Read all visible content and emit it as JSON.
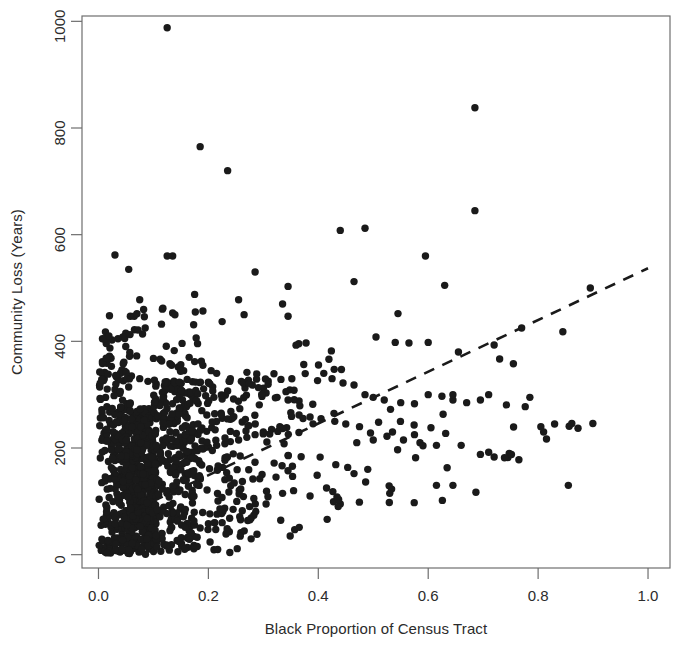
{
  "chart_data": {
    "type": "scatter",
    "title": "",
    "xlabel": "Black Proportion of Census Tract",
    "ylabel": "Community Loss (Years)",
    "xlim": [
      -0.03,
      1.04
    ],
    "ylim": [
      -25,
      1010
    ],
    "xticks": [
      0.0,
      0.2,
      0.4,
      0.6,
      0.8,
      1.0
    ],
    "xtick_labels": [
      "0.0",
      "0.2",
      "0.4",
      "0.6",
      "0.8",
      "1.0"
    ],
    "yticks": [
      0,
      200,
      400,
      600,
      800,
      1000
    ],
    "ytick_labels": [
      "0",
      "200",
      "400",
      "600",
      "800",
      "1000"
    ],
    "grid": false,
    "legend": null,
    "marker": {
      "shape": "circle",
      "size_px": 7.4,
      "color": "#1a1a1a"
    },
    "trend_line": {
      "style": "dashed",
      "color": "#1a1a1a",
      "x_start": 0.0,
      "y_start": 52,
      "x_end": 1.0,
      "y_end": 537
    },
    "points": [
      [
        0.125,
        988
      ],
      [
        0.185,
        765
      ],
      [
        0.235,
        720
      ],
      [
        0.685,
        838
      ],
      [
        0.685,
        645
      ],
      [
        0.44,
        608
      ],
      [
        0.485,
        612
      ],
      [
        0.03,
        562
      ],
      [
        0.125,
        560
      ],
      [
        0.135,
        560
      ],
      [
        0.055,
        535
      ],
      [
        0.595,
        560
      ],
      [
        0.285,
        530
      ],
      [
        0.465,
        512
      ],
      [
        0.63,
        505
      ],
      [
        0.345,
        503
      ],
      [
        0.895,
        500
      ],
      [
        0.075,
        478
      ],
      [
        0.175,
        488
      ],
      [
        0.255,
        478
      ],
      [
        0.335,
        470
      ],
      [
        0.02,
        448
      ],
      [
        0.058,
        447
      ],
      [
        0.065,
        447
      ],
      [
        0.135,
        453
      ],
      [
        0.265,
        450
      ],
      [
        0.345,
        447
      ],
      [
        0.545,
        452
      ],
      [
        0.225,
        437
      ],
      [
        0.085,
        425
      ],
      [
        0.77,
        425
      ],
      [
        0.845,
        418
      ],
      [
        0.505,
        408
      ],
      [
        0.54,
        398
      ],
      [
        0.565,
        397
      ],
      [
        0.6,
        398
      ],
      [
        0.72,
        393
      ],
      [
        0.655,
        380
      ],
      [
        0.73,
        367
      ],
      [
        0.755,
        358
      ],
      [
        0.02,
        372
      ],
      [
        0.045,
        358
      ],
      [
        0.1,
        368
      ],
      [
        0.115,
        363
      ],
      [
        0.13,
        358
      ],
      [
        0.145,
        352
      ],
      [
        0.155,
        345
      ],
      [
        0.165,
        370
      ],
      [
        0.175,
        362
      ],
      [
        0.19,
        355
      ],
      [
        0.205,
        345
      ],
      [
        0.215,
        340
      ],
      [
        0.04,
        340
      ],
      [
        0.06,
        335
      ],
      [
        0.075,
        330
      ],
      [
        0.09,
        325
      ],
      [
        0.105,
        320
      ],
      [
        0.12,
        317
      ],
      [
        0.135,
        313
      ],
      [
        0.15,
        308
      ],
      [
        0.165,
        305
      ],
      [
        0.18,
        302
      ],
      [
        0.195,
        298
      ],
      [
        0.21,
        295
      ],
      [
        0.225,
        292
      ],
      [
        0.24,
        330
      ],
      [
        0.26,
        325
      ],
      [
        0.28,
        318
      ],
      [
        0.3,
        312
      ],
      [
        0.305,
        303
      ],
      [
        0.325,
        295
      ],
      [
        0.345,
        290
      ],
      [
        0.365,
        288
      ],
      [
        0.39,
        282
      ],
      [
        0.41,
        340
      ],
      [
        0.425,
        330
      ],
      [
        0.445,
        322
      ],
      [
        0.465,
        318
      ],
      [
        0.485,
        300
      ],
      [
        0.5,
        295
      ],
      [
        0.52,
        290
      ],
      [
        0.55,
        285
      ],
      [
        0.575,
        283
      ],
      [
        0.6,
        300
      ],
      [
        0.625,
        297
      ],
      [
        0.645,
        290
      ],
      [
        0.67,
        285
      ],
      [
        0.695,
        290
      ],
      [
        0.71,
        300
      ],
      [
        0.785,
        295
      ],
      [
        0.805,
        240
      ],
      [
        0.81,
        230
      ],
      [
        0.83,
        245
      ],
      [
        0.855,
        130
      ],
      [
        0.72,
        183
      ],
      [
        0.745,
        182
      ],
      [
        0.765,
        178
      ],
      [
        0.645,
        300
      ],
      [
        0.605,
        238
      ],
      [
        0.575,
        225
      ],
      [
        0.535,
        230
      ],
      [
        0.5,
        215
      ],
      [
        0.47,
        210
      ],
      [
        0.44,
        95
      ],
      [
        0.415,
        125
      ],
      [
        0.385,
        110
      ],
      [
        0.355,
        120
      ],
      [
        0.335,
        115
      ],
      [
        0.305,
        95
      ],
      [
        0.275,
        90
      ],
      [
        0.245,
        85
      ],
      [
        0.225,
        60
      ],
      [
        0.2,
        58
      ],
      [
        0.185,
        50
      ],
      [
        0.165,
        45
      ],
      [
        0.145,
        70
      ],
      [
        0.13,
        45
      ],
      [
        0.115,
        40
      ],
      [
        0.1,
        38
      ],
      [
        0.085,
        35
      ],
      [
        0.07,
        32
      ],
      [
        0.055,
        28
      ],
      [
        0.04,
        25
      ],
      [
        0.025,
        20
      ],
      [
        0.015,
        15
      ],
      [
        0.008,
        12
      ],
      [
        0.005,
        8
      ],
      [
        0.012,
        5
      ],
      [
        0.022,
        3
      ],
      [
        0.615,
        130
      ],
      [
        0.645,
        130
      ],
      [
        0.49,
        160
      ],
      [
        0.465,
        152
      ],
      [
        0.53,
        115
      ],
      [
        0.695,
        188
      ],
      [
        0.71,
        192
      ],
      [
        0.66,
        205
      ],
      [
        0.615,
        205
      ],
      [
        0.585,
        210
      ],
      [
        0.555,
        215
      ],
      [
        0.525,
        222
      ],
      [
        0.495,
        228
      ],
      [
        0.475,
        240
      ],
      [
        0.45,
        245
      ],
      [
        0.43,
        250
      ],
      [
        0.405,
        255
      ],
      [
        0.385,
        258
      ],
      [
        0.365,
        262
      ],
      [
        0.35,
        266
      ],
      [
        0.33,
        240
      ],
      [
        0.315,
        235
      ],
      [
        0.3,
        230
      ],
      [
        0.285,
        225
      ],
      [
        0.27,
        220
      ],
      [
        0.255,
        215
      ],
      [
        0.24,
        212
      ],
      [
        0.23,
        208
      ],
      [
        0.215,
        205
      ],
      [
        0.2,
        202
      ],
      [
        0.19,
        198
      ],
      [
        0.18,
        195
      ],
      [
        0.17,
        192
      ],
      [
        0.16,
        188
      ],
      [
        0.15,
        185
      ],
      [
        0.14,
        182
      ],
      [
        0.13,
        178
      ],
      [
        0.12,
        175
      ],
      [
        0.11,
        172
      ],
      [
        0.1,
        168
      ],
      [
        0.09,
        165
      ],
      [
        0.08,
        162
      ],
      [
        0.07,
        158
      ],
      [
        0.06,
        155
      ],
      [
        0.05,
        152
      ],
      [
        0.04,
        148
      ],
      [
        0.03,
        145
      ],
      [
        0.02,
        142
      ],
      [
        0.012,
        138
      ],
      [
        0.006,
        135
      ]
    ],
    "cluster_description": "Dense mass of observations concentrated between x=0.00 and x=0.15 spanning y=0 to y=260, thinning out toward higher x values.",
    "n_points_approx": 900
  },
  "axes": {
    "x_title": "Black Proportion of Census Tract",
    "y_title": "Community Loss (Years)"
  }
}
